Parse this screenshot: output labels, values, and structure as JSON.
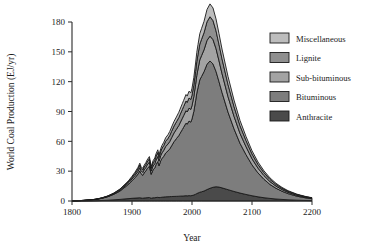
{
  "chart_data": {
    "type": "area",
    "stacked": true,
    "title": "",
    "xlabel": "Year",
    "ylabel": "World Coal Production (EJ/yr)",
    "xlim": [
      1800,
      2200
    ],
    "ylim": [
      0,
      180
    ],
    "xticks": [
      1800,
      1900,
      2000,
      2100,
      2200
    ],
    "yticks": [
      0,
      30,
      60,
      90,
      120,
      150,
      180
    ],
    "xtick_labels": [
      "1800",
      "1900",
      "2000",
      "2100",
      "2200"
    ],
    "ytick_labels": [
      "0",
      "30",
      "60",
      "90",
      "120",
      "150",
      "180"
    ],
    "grid": false,
    "legend_position": "upper right",
    "legend_entries": [
      "Miscellaneous",
      "Lignite",
      "Sub-bituminous",
      "Bituminous",
      "Anthracite"
    ],
    "x": [
      1800,
      1810,
      1820,
      1830,
      1840,
      1850,
      1860,
      1870,
      1880,
      1890,
      1895,
      1900,
      1905,
      1910,
      1913,
      1915,
      1918,
      1920,
      1923,
      1925,
      1929,
      1932,
      1935,
      1938,
      1940,
      1943,
      1945,
      1948,
      1950,
      1953,
      1956,
      1960,
      1963,
      1966,
      1970,
      1974,
      1978,
      1980,
      1984,
      1986,
      1990,
      1992,
      1995,
      1998,
      2000,
      2003,
      2006,
      2008,
      2010,
      2013,
      2016,
      2020,
      2025,
      2030,
      2035,
      2040,
      2045,
      2050,
      2060,
      2070,
      2080,
      2090,
      2100,
      2110,
      2120,
      2130,
      2140,
      2150,
      2160,
      2175,
      2190,
      2200
    ],
    "series": [
      {
        "name": "Anthracite",
        "color": "#4a4a4a",
        "values": [
          0.0,
          0.05,
          0.1,
          0.2,
          0.3,
          0.5,
          0.8,
          1.2,
          1.6,
          2.2,
          2.4,
          2.7,
          2.9,
          3.1,
          3.3,
          3.0,
          2.8,
          3.0,
          3.2,
          3.3,
          3.5,
          2.8,
          3.2,
          3.3,
          3.5,
          3.7,
          3.4,
          3.6,
          3.8,
          4.0,
          4.2,
          4.3,
          4.4,
          4.5,
          4.6,
          4.7,
          4.8,
          4.9,
          5.0,
          5.1,
          5.3,
          5.2,
          5.4,
          5.3,
          5.5,
          6.0,
          6.8,
          7.5,
          8.0,
          8.8,
          9.3,
          10.0,
          11.5,
          12.8,
          13.8,
          14.3,
          14.0,
          13.2,
          11.4,
          9.6,
          8.0,
          6.6,
          5.3,
          4.2,
          3.3,
          2.6,
          2.0,
          1.6,
          1.2,
          0.8,
          0.5,
          0.4
        ]
      },
      {
        "name": "Bituminous",
        "color": "#7d7d7d",
        "values": [
          0.2,
          0.3,
          0.5,
          0.8,
          1.3,
          2.2,
          3.6,
          5.6,
          8.4,
          12.5,
          14.8,
          17.5,
          20.5,
          24.0,
          27.0,
          24.5,
          23.0,
          25.0,
          27.0,
          29.0,
          31.5,
          24.0,
          28.0,
          30.0,
          33.0,
          36.0,
          32.0,
          37.0,
          39.0,
          41.0,
          44.0,
          46.0,
          48.0,
          51.0,
          55.0,
          58.0,
          61.0,
          63.0,
          67.0,
          69.0,
          73.0,
          72.0,
          75.0,
          74.0,
          77.0,
          84.0,
          94.0,
          101.0,
          106.0,
          113.0,
          116.0,
          120.0,
          126.0,
          128.0,
          124.0,
          116.0,
          106.0,
          96.0,
          78.0,
          63.0,
          50.0,
          40.0,
          31.0,
          24.0,
          18.5,
          14.0,
          10.8,
          8.2,
          6.2,
          4.0,
          2.6,
          2.0
        ]
      },
      {
        "name": "Sub-bituminous",
        "color": "#a3a3a3",
        "values": [
          0.0,
          0.0,
          0.0,
          0.05,
          0.1,
          0.2,
          0.3,
          0.5,
          0.8,
          1.2,
          1.5,
          1.9,
          2.3,
          2.8,
          3.2,
          3.0,
          2.9,
          3.2,
          3.5,
          3.7,
          4.1,
          3.3,
          3.9,
          4.2,
          4.6,
          5.0,
          4.6,
          5.2,
          5.6,
          6.0,
          6.5,
          7.0,
          7.5,
          8.1,
          8.8,
          9.4,
          10.1,
          10.5,
          11.3,
          11.7,
          12.5,
          12.3,
          13.0,
          12.8,
          13.4,
          14.8,
          16.5,
          17.8,
          18.8,
          20.2,
          21.0,
          22.0,
          24.0,
          25.0,
          24.5,
          23.0,
          21.0,
          19.0,
          15.6,
          12.6,
          10.0,
          8.0,
          6.2,
          4.8,
          3.7,
          2.9,
          2.2,
          1.7,
          1.3,
          0.9,
          0.6,
          0.4
        ]
      },
      {
        "name": "Lignite",
        "color": "#8f8f8f",
        "values": [
          0.0,
          0.0,
          0.0,
          0.05,
          0.1,
          0.2,
          0.3,
          0.5,
          0.8,
          1.2,
          1.4,
          1.7,
          2.0,
          2.4,
          2.7,
          2.5,
          2.4,
          2.7,
          2.9,
          3.1,
          3.4,
          2.7,
          3.2,
          3.5,
          3.8,
          4.1,
          3.8,
          4.3,
          4.6,
          4.9,
          5.3,
          5.7,
          6.1,
          6.5,
          7.0,
          7.5,
          8.0,
          8.3,
          8.9,
          9.2,
          9.8,
          9.6,
          10.2,
          10.0,
          10.5,
          11.6,
          12.9,
          13.9,
          14.7,
          15.8,
          16.4,
          17.2,
          18.7,
          19.5,
          19.1,
          17.9,
          16.4,
          14.8,
          12.2,
          9.8,
          7.8,
          6.2,
          4.8,
          3.7,
          2.9,
          2.2,
          1.7,
          1.3,
          1.0,
          0.7,
          0.45,
          0.3
        ]
      },
      {
        "name": "Miscellaneous",
        "color": "#bdbdbd",
        "values": [
          0.0,
          0.0,
          0.0,
          0.02,
          0.05,
          0.1,
          0.2,
          0.3,
          0.5,
          0.8,
          0.9,
          1.1,
          1.3,
          1.6,
          1.8,
          1.7,
          1.6,
          1.8,
          1.9,
          2.0,
          2.2,
          1.8,
          2.1,
          2.3,
          2.5,
          2.7,
          2.5,
          2.8,
          3.0,
          3.2,
          3.5,
          3.7,
          4.0,
          4.3,
          4.6,
          4.9,
          5.3,
          5.5,
          5.9,
          6.1,
          6.5,
          6.4,
          6.8,
          6.6,
          7.0,
          7.7,
          8.6,
          9.3,
          9.8,
          10.5,
          10.9,
          11.4,
          12.4,
          12.9,
          12.7,
          11.9,
          10.9,
          9.8,
          8.1,
          6.5,
          5.2,
          4.1,
          3.2,
          2.5,
          1.9,
          1.5,
          1.1,
          0.9,
          0.7,
          0.45,
          0.3,
          0.2
        ]
      }
    ]
  }
}
